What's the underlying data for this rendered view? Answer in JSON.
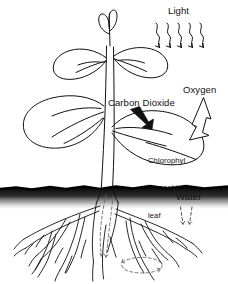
{
  "diagram": {
    "background_color": "#ffffff",
    "ink_color": "#111111",
    "soil_color": "#000000",
    "labels": {
      "light": "Light",
      "oxygen": "Oxygen",
      "carbon_dioxide": "Carbon Dioxide",
      "water": "Water",
      "chlorophyl_line1": "Chlorophyl",
      "chlorophyl_line2": "present in",
      "chlorophyl_line3": "leaf"
    },
    "arrows": {
      "light_rays": {
        "name": "wavy-light-rays",
        "count": 5,
        "style": "wavy",
        "direction": "down-left",
        "fill": "none",
        "stroke": "#111111"
      },
      "oxygen_arrow": {
        "name": "oxygen-outline-arrow",
        "style": "hollow-outline",
        "direction": "up-right",
        "fill": "#ffffff",
        "stroke": "#111111"
      },
      "carbon_dioxide_arrow": {
        "name": "carbon-dioxide-solid-arrow",
        "style": "solid-filled",
        "direction": "down-right",
        "fill": "#111111",
        "stroke": "#111111"
      },
      "water_arrows": {
        "name": "water-dashed-arrows",
        "count": 2,
        "style": "dashed",
        "direction": "down",
        "fill": "none",
        "stroke": "#444444"
      }
    },
    "plant_parts": {
      "top_bud": "top-bud",
      "upper_left_leaf": "upper-left-leaf",
      "upper_right_leaf": "upper-right-leaf",
      "large_left_leaf": "large-left-leaf",
      "large_right_leaf": "large-right-leaf",
      "stem": "plant-stem",
      "roots": "root-system",
      "soil_line": "soil-ground-line"
    }
  }
}
